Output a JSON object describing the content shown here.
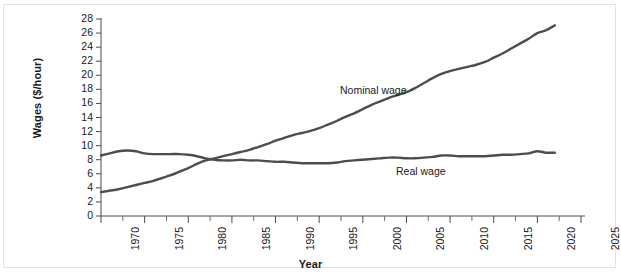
{
  "chart_data": {
    "type": "line",
    "title": "",
    "xlabel": "Year",
    "ylabel": "Wages ($/hour)",
    "xlim": [
      1970,
      2025
    ],
    "ylim": [
      0,
      28
    ],
    "ytick_step": 2,
    "xtick_step": 5,
    "grid": false,
    "legend_position": "inline-annotations",
    "yticks": [
      0,
      2,
      4,
      6,
      8,
      10,
      12,
      14,
      16,
      18,
      20,
      22,
      24,
      26,
      28
    ],
    "xticks": [
      1970,
      1975,
      1980,
      1985,
      1990,
      1995,
      2000,
      2005,
      2010,
      2015,
      2020,
      2025
    ],
    "x_minor_ticks_between": 1,
    "line_color": "#4d4d4d",
    "line_width_px": 2.4,
    "x": [
      1970,
      1971,
      1972,
      1973,
      1974,
      1975,
      1976,
      1977,
      1978,
      1979,
      1980,
      1981,
      1982,
      1983,
      1984,
      1985,
      1986,
      1987,
      1988,
      1989,
      1990,
      1991,
      1992,
      1993,
      1994,
      1995,
      1996,
      1997,
      1998,
      1999,
      2000,
      2001,
      2002,
      2003,
      2004,
      2005,
      2006,
      2007,
      2008,
      2009,
      2010,
      2011,
      2012,
      2013,
      2014,
      2015,
      2016,
      2017,
      2018,
      2019,
      2020,
      2021,
      2022
    ],
    "series": [
      {
        "name": "Nominal wage",
        "label": "Nominal wage",
        "label_position": {
          "x": 1997,
          "y": 16.9
        },
        "values": [
          3.4,
          3.6,
          3.8,
          4.1,
          4.4,
          4.7,
          5.0,
          5.4,
          5.8,
          6.3,
          6.8,
          7.4,
          7.9,
          8.2,
          8.5,
          8.8,
          9.1,
          9.4,
          9.8,
          10.2,
          10.7,
          11.1,
          11.5,
          11.8,
          12.1,
          12.5,
          13.0,
          13.5,
          14.1,
          14.6,
          15.2,
          15.8,
          16.3,
          16.8,
          17.2,
          17.6,
          18.2,
          18.9,
          19.6,
          20.2,
          20.6,
          20.9,
          21.2,
          21.5,
          21.9,
          22.5,
          23.1,
          23.8,
          24.5,
          25.2,
          26.0,
          26.4,
          27.1
        ]
      },
      {
        "name": "Real wage",
        "label": "Real wage",
        "label_position": {
          "x": 2002,
          "y": 6.8
        },
        "values": [
          8.6,
          8.9,
          9.2,
          9.3,
          9.2,
          8.9,
          8.8,
          8.8,
          8.8,
          8.8,
          8.7,
          8.5,
          8.2,
          8.0,
          7.9,
          7.9,
          8.0,
          7.9,
          7.9,
          7.8,
          7.7,
          7.7,
          7.6,
          7.5,
          7.5,
          7.5,
          7.5,
          7.6,
          7.8,
          7.9,
          8.0,
          8.1,
          8.2,
          8.3,
          8.3,
          8.2,
          8.2,
          8.3,
          8.4,
          8.6,
          8.6,
          8.5,
          8.5,
          8.5,
          8.5,
          8.6,
          8.7,
          8.7,
          8.8,
          8.9,
          9.2,
          9.0,
          9.0
        ]
      }
    ]
  }
}
